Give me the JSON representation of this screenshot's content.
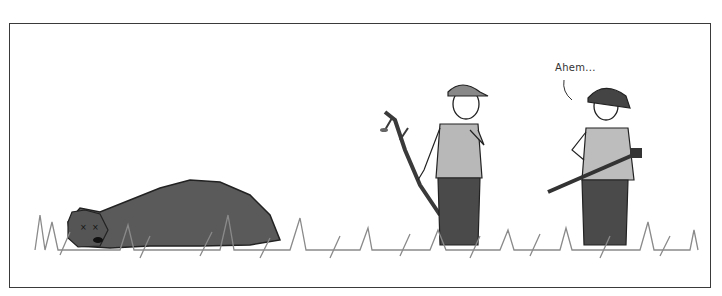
{
  "comic": {
    "panel_count": 1,
    "speech": {
      "speaker": "hunter",
      "text": "Ahem..."
    },
    "characters": [
      {
        "id": "bear",
        "description": "dead bear lying in grass with X eyes"
      },
      {
        "id": "man-with-stick",
        "description": "man in cap holding a branch, hand on chin"
      },
      {
        "id": "hunter",
        "description": "hunter in bush hat holding a rifle"
      }
    ],
    "colors": {
      "border": "#3a3a3a",
      "ink": "#222222",
      "bear_fur": "#5a5a5a",
      "grass": "#8a8a8a",
      "shirt": "#b8b8b8",
      "pants": "#4a4a4a"
    }
  }
}
